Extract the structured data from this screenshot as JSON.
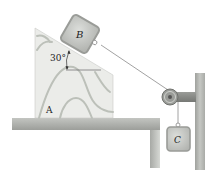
{
  "figure": {
    "type": "mechanics-diagram"
  },
  "labels": {
    "block_b": "B",
    "block_c": "C",
    "wedge_a": "A",
    "angle": "30°"
  },
  "colors": {
    "wedge_fill": "#e9ebe7",
    "wedge_grain": "#bfc3bc",
    "table_top": "#a8aaa6",
    "table_edge": "#8d8f8b",
    "block_fill": "#c9cbc7",
    "block_border": "#9c9e9a",
    "cord": "#8a8a8a",
    "wall": "#b4b6b2",
    "pulley": "#8b8d89"
  },
  "geometry": {
    "incline_angle_deg": 30
  }
}
